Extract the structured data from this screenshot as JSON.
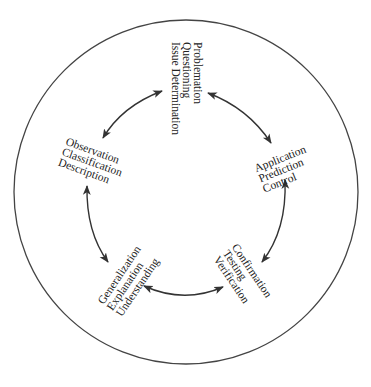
{
  "diagram": {
    "type": "cycle",
    "colors": {
      "stroke": "#333333",
      "text": "#222222",
      "background": "#ffffff"
    },
    "outer_circle": {
      "cx": 186,
      "cy": 192,
      "r": 172
    },
    "nodes": [
      {
        "id": "problemation",
        "lines": [
          "Problemation",
          "Questioning",
          "Issue Determination"
        ]
      },
      {
        "id": "application",
        "lines": [
          "Application",
          "Prediction",
          "Control"
        ]
      },
      {
        "id": "confirmation",
        "lines": [
          "Confirmation",
          "Testing",
          "Verification"
        ]
      },
      {
        "id": "generalization",
        "lines": [
          "Generalization",
          "Explanation",
          "Understanding"
        ]
      },
      {
        "id": "observation",
        "lines": [
          "Observation",
          "Classification",
          "Description"
        ]
      }
    ],
    "edges": [
      {
        "from": "observation",
        "to": "problemation",
        "bidirectional": true
      },
      {
        "from": "problemation",
        "to": "application",
        "bidirectional": true
      },
      {
        "from": "application",
        "to": "confirmation",
        "bidirectional": true
      },
      {
        "from": "confirmation",
        "to": "generalization",
        "bidirectional": true
      },
      {
        "from": "generalization",
        "to": "observation",
        "bidirectional": true
      }
    ]
  }
}
